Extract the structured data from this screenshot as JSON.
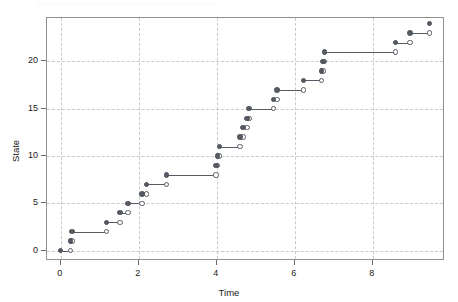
{
  "figure": {
    "background_color": "#ffffff",
    "frame_color": "#8f8f8f",
    "grid_color": "#c9c9c9",
    "mark_color": "#555a63"
  },
  "axes": {
    "x_title": "Time",
    "y_title": "State",
    "x_ticks": [
      "0",
      "2",
      "4",
      "6",
      "8"
    ],
    "y_ticks": [
      "0",
      "5",
      "10",
      "15",
      "20"
    ]
  },
  "chart_data": {
    "type": "line",
    "title": "",
    "xlabel": "Time",
    "ylabel": "State",
    "xlim": [
      -0.35,
      9.85
    ],
    "ylim": [
      -1.1,
      24.6
    ],
    "x_ticks": [
      0,
      2,
      4,
      6,
      8
    ],
    "y_ticks": [
      0,
      5,
      10,
      15,
      20
    ],
    "grid": true,
    "grid_style": "dashed",
    "legend": null,
    "marker_style": {
      "interval_start": "filled-circle",
      "interval_end": "open-circle"
    },
    "series": [
      {
        "name": "State path",
        "segments": [
          {
            "state": 0,
            "t_start": 0.0,
            "t_end": 0.25
          },
          {
            "state": 1,
            "t_start": 0.25,
            "t_end": 0.29
          },
          {
            "state": 2,
            "t_start": 0.29,
            "t_end": 1.18
          },
          {
            "state": 3,
            "t_start": 1.18,
            "t_end": 1.52
          },
          {
            "state": 4,
            "t_start": 1.52,
            "t_end": 1.73
          },
          {
            "state": 5,
            "t_start": 1.73,
            "t_end": 2.08
          },
          {
            "state": 6,
            "t_start": 2.08,
            "t_end": 2.2
          },
          {
            "state": 7,
            "t_start": 2.2,
            "t_end": 2.72
          },
          {
            "state": 8,
            "t_start": 2.72,
            "t_end": 3.98
          },
          {
            "state": 9,
            "t_start": 3.98,
            "t_end": 4.02
          },
          {
            "state": 10,
            "t_start": 4.02,
            "t_end": 4.07
          },
          {
            "state": 11,
            "t_start": 4.07,
            "t_end": 4.6
          },
          {
            "state": 12,
            "t_start": 4.6,
            "t_end": 4.67
          },
          {
            "state": 13,
            "t_start": 4.67,
            "t_end": 4.78
          },
          {
            "state": 14,
            "t_start": 4.78,
            "t_end": 4.83
          },
          {
            "state": 15,
            "t_start": 4.83,
            "t_end": 5.45
          },
          {
            "state": 16,
            "t_start": 5.45,
            "t_end": 5.54
          },
          {
            "state": 17,
            "t_start": 5.54,
            "t_end": 6.22
          },
          {
            "state": 18,
            "t_start": 6.22,
            "t_end": 6.68
          },
          {
            "state": 19,
            "t_start": 6.68,
            "t_end": 6.72
          },
          {
            "state": 20,
            "t_start": 6.72,
            "t_end": 6.76
          },
          {
            "state": 21,
            "t_start": 6.76,
            "t_end": 8.58
          },
          {
            "state": 22,
            "t_start": 8.58,
            "t_end": 8.95
          },
          {
            "state": 23,
            "t_start": 8.95,
            "t_end": 9.45
          },
          {
            "state": 24,
            "t_start": 9.45,
            "t_end": 9.45
          }
        ]
      }
    ],
    "jump_times": [
      0.0,
      0.25,
      0.29,
      1.18,
      1.52,
      1.73,
      2.08,
      2.2,
      2.72,
      3.98,
      4.02,
      4.07,
      4.6,
      4.67,
      4.78,
      4.83,
      5.45,
      5.54,
      6.22,
      6.68,
      6.72,
      6.76,
      8.58,
      8.95,
      9.45
    ],
    "states": [
      0,
      1,
      2,
      3,
      4,
      5,
      6,
      7,
      8,
      9,
      10,
      11,
      12,
      13,
      14,
      15,
      16,
      17,
      18,
      19,
      20,
      21,
      22,
      23,
      24
    ]
  }
}
